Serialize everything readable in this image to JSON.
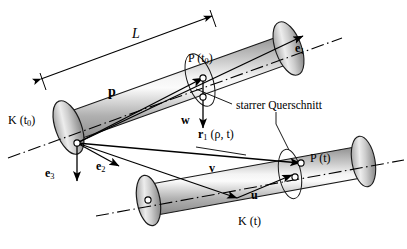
{
  "figure": {
    "type": "technical-diagram",
    "background_color": "#ffffff",
    "line_color": "#000000",
    "cylinder_fill_light": "#f2f2f2",
    "cylinder_fill_mid": "#c9c9c9",
    "cylinder_fill_dark": "#8d8d8d",
    "width": 407,
    "height": 249
  },
  "labels": {
    "length_L": "L",
    "config_initial": "K (t",
    "config_initial_sub": "0",
    "config_initial_close": ")",
    "config_current": "K (t)",
    "point_initial": "P (t",
    "point_initial_sub": "0",
    "point_initial_close": ")",
    "point_current": "P (t)",
    "rigid_cross_section": "starrer Querschnitt",
    "vector_p": "p",
    "vector_w": "w",
    "vector_v": "v",
    "vector_u": "u",
    "vector_e1": "e",
    "vector_e1_sub": "1",
    "vector_e2": "e",
    "vector_e2_sub": "2",
    "vector_e3": "e",
    "vector_e3_sub": "3",
    "position_vector_r": "r",
    "position_vector_r_sub": "1",
    "position_vector_args": " (ρ, t)"
  }
}
